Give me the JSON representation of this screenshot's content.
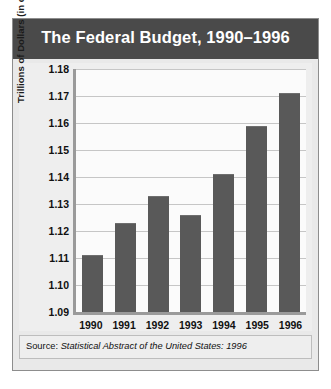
{
  "figure": {
    "title": "The Federal Budget, 1990–1996",
    "source_label": "Source:",
    "source_reference": "Statistical Abstract of the United States: 1996"
  },
  "colors": {
    "title_band": "#4a4a4a",
    "title_text": "#ffffff",
    "bar_fill": "#595959",
    "panel_background": "#eeeeee",
    "plot_background": "#fbfbfb",
    "gridline": "#c6c6c6",
    "axis_line": "#9a9a9a",
    "page_background": "#ffffff"
  },
  "chart_data": {
    "type": "bar",
    "title": "The Federal Budget, 1990–1996",
    "xlabel": "",
    "ylabel": "Trillions of Dollars (in constant 1987 dollars)",
    "categories": [
      "1990",
      "1991",
      "1992",
      "1993",
      "1994",
      "1995",
      "1996"
    ],
    "values": [
      1.111,
      1.123,
      1.133,
      1.126,
      1.141,
      1.159,
      1.171
    ],
    "ylim": [
      1.09,
      1.18
    ],
    "ytick_labels": [
      "1.18",
      "1.17",
      "1.16",
      "1.15",
      "1.14",
      "1.13",
      "1.12",
      "1.11",
      "1.10",
      "1.09"
    ],
    "ytick_values": [
      1.18,
      1.17,
      1.16,
      1.15,
      1.14,
      1.13,
      1.12,
      1.11,
      1.1,
      1.09
    ],
    "grid": true,
    "legend": false,
    "legend_position": "none",
    "series": [
      {
        "name": "Federal Budget",
        "values": [
          1.111,
          1.123,
          1.133,
          1.126,
          1.141,
          1.159,
          1.171
        ]
      }
    ]
  }
}
